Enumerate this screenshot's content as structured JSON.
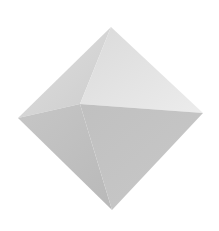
{
  "figure": {
    "shape": "octahedron",
    "background": "#ffffff",
    "vertices": {
      "top": [
        111,
        27
      ],
      "left": [
        18,
        118
      ],
      "right": [
        203,
        113
      ],
      "bottom": [
        112,
        210
      ],
      "front": [
        80,
        104
      ]
    },
    "faces": [
      {
        "name": "upper-left",
        "points": "111,27 18,118 80,104",
        "color": "#d3d3d3"
      },
      {
        "name": "upper-right",
        "points": "111,27 80,104 203,113",
        "color": "#e2e2e2"
      },
      {
        "name": "lower-left",
        "points": "18,118 80,104 112,210",
        "color": "#bdbdbd"
      },
      {
        "name": "lower-right",
        "points": "80,104 203,113 112,210",
        "color": "#c3c3c3"
      }
    ]
  }
}
